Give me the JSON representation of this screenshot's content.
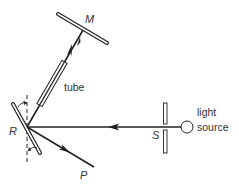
{
  "diagram": {
    "labels": {
      "mirror_fixed": "M",
      "tube": "tube",
      "rotating_mirror": "R",
      "slit": "S",
      "output_point": "P",
      "light_source_line1": "light",
      "light_source_line2": "source"
    },
    "components": [
      {
        "id": "M",
        "description": "fixed mirror at far end"
      },
      {
        "id": "tube",
        "description": "tube along beam path between R and M"
      },
      {
        "id": "R",
        "description": "rotating mirror with rotation arrows and vertical dashed axis"
      },
      {
        "id": "S",
        "description": "slit"
      },
      {
        "id": "light source",
        "description": "circle emitter"
      },
      {
        "id": "P",
        "description": "reflected beam endpoint"
      }
    ],
    "beam_paths": [
      {
        "from": "light source",
        "to": "R",
        "via": "S",
        "direction": "leftward"
      },
      {
        "from": "R",
        "to": "M",
        "via": "tube",
        "direction": "up-right"
      },
      {
        "from": "R",
        "to": "P",
        "direction": "down-right"
      }
    ],
    "colors": {
      "line": "#222222",
      "label": "#333333",
      "background": "#ffffff"
    }
  }
}
